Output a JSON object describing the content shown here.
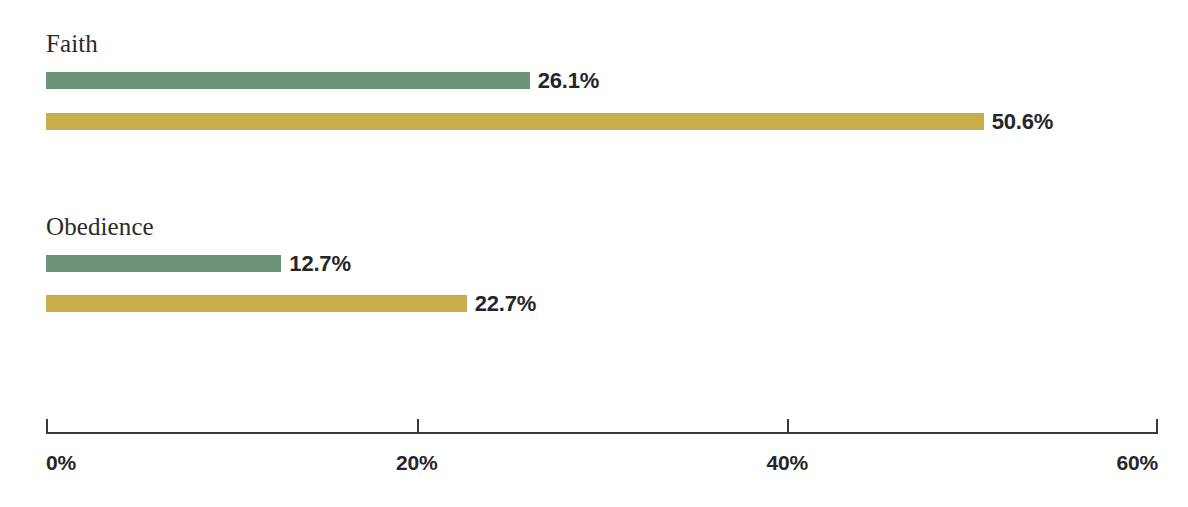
{
  "chart_data": {
    "type": "bar",
    "orientation": "horizontal",
    "title": "",
    "subtitle": "",
    "xlabel": "",
    "ylabel": "",
    "xlim": [
      0,
      60
    ],
    "grid": false,
    "legend": "none",
    "categories": [
      "Faith",
      "Obedience"
    ],
    "series": [
      {
        "name": "green",
        "color": "#6b9478",
        "values": [
          26.1,
          12.7
        ],
        "labels": [
          "26.1%",
          "12.7%"
        ]
      },
      {
        "name": "gold",
        "color": "#c9ad4a",
        "values": [
          50.6,
          22.7
        ],
        "labels": [
          "50.6%",
          "22.7%"
        ]
      }
    ],
    "axis": {
      "ticks": [
        0,
        20,
        40,
        60
      ],
      "tick_labels": [
        "0%",
        "20%",
        "40%",
        "60%"
      ],
      "line_color": "#3a3a3a"
    },
    "groups": [
      {
        "label": "Faith",
        "bars": [
          {
            "series": "green",
            "value": 26.1,
            "value_label": "26.1%",
            "color": "#6b9478"
          },
          {
            "series": "gold",
            "value": 50.6,
            "value_label": "50.6%",
            "color": "#c9ad4a"
          }
        ]
      },
      {
        "label": "Obedience",
        "bars": [
          {
            "series": "green",
            "value": 12.7,
            "value_label": "12.7%",
            "color": "#6b9478"
          },
          {
            "series": "gold",
            "value": 22.7,
            "value_label": "22.7%",
            "color": "#c9ad4a"
          }
        ]
      }
    ],
    "colors": {
      "background": "#ffffff",
      "green": "#6b9478",
      "gold": "#c9ad4a",
      "text": "#26262a",
      "label_text": "#2b2b2b",
      "axis": "#3a3a3a"
    }
  },
  "layout": {
    "plot_left_px": 46,
    "plot_right_px": 1158,
    "axis_y_px": 432,
    "group_label_y": [
      31,
      214
    ],
    "bar_rows_y": [
      72,
      113,
      255,
      295
    ],
    "bar_height_px": 17
  }
}
